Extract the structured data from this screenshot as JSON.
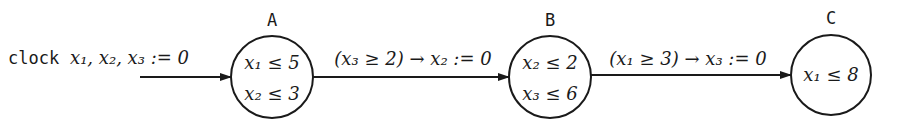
{
  "diagram": {
    "type": "timed-automaton",
    "init": {
      "keyword": "clock",
      "clocks": "x₁, x₂, x₃ := 0"
    },
    "states": [
      {
        "id": "A",
        "label": "A",
        "invariants": [
          "x₁ ≤ 5",
          "x₂ ≤ 3"
        ]
      },
      {
        "id": "B",
        "label": "B",
        "invariants": [
          "x₂ ≤ 2",
          "x₃ ≤ 6"
        ]
      },
      {
        "id": "C",
        "label": "C",
        "invariants": [
          "x₁ ≤ 8"
        ]
      }
    ],
    "transitions": [
      {
        "from": "A",
        "to": "B",
        "label": "(x₃ ≥ 2) → x₂ := 0"
      },
      {
        "from": "B",
        "to": "C",
        "label": "(x₁ ≥ 3) → x₃ := 0"
      }
    ],
    "colors": {
      "stroke": "#1a1a1a",
      "background": "#ffffff"
    }
  }
}
